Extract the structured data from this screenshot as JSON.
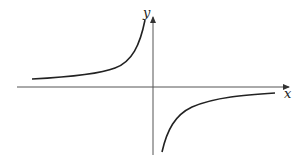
{
  "figure": {
    "type": "graph-of-function",
    "axes": {
      "x_label": "x",
      "y_label": "y"
    },
    "colors": {
      "curve": "#222222",
      "axes": "#555555",
      "background": "#ffffff"
    }
  }
}
